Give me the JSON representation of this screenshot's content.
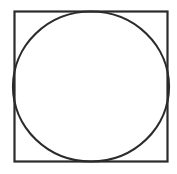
{
  "figure": {
    "title": "Circle inscribed in a square",
    "canvas": {
      "width": 177,
      "height": 174,
      "background_color": "#ffffff"
    },
    "ink_color": "#2b2b2b",
    "shapes": [
      {
        "name": "square",
        "type": "rectangle",
        "x": 14.5,
        "y": 11.5,
        "width": 153,
        "height": 150,
        "stroke_color": "#2b2b2b",
        "stroke_width": 2.2,
        "fill": "none"
      },
      {
        "name": "circle",
        "type": "ellipse",
        "center_x": 91,
        "center_y": 86.5,
        "radius_x": 78,
        "radius_y": 75,
        "stroke_color": "#2b2b2b",
        "stroke_width": 2.2,
        "fill": "none",
        "relationship": "inscribed in square, tangent at top, bottom, left and right edges"
      }
    ],
    "labels": []
  }
}
